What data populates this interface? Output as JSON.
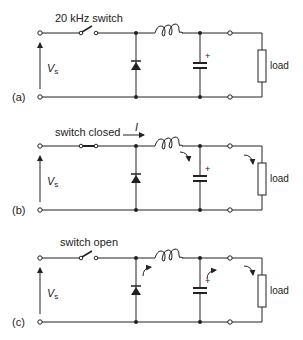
{
  "figure": {
    "panels": [
      {
        "id": "a",
        "label": "(a)",
        "switch_label": "20 kHz switch",
        "switch_state": "open",
        "source_label": "V",
        "source_sub": "s",
        "load_label": "load",
        "cap_polarity": "+",
        "current_label": ""
      },
      {
        "id": "b",
        "label": "(b)",
        "switch_label": "switch closed",
        "switch_state": "closed",
        "source_label": "V",
        "source_sub": "s",
        "load_label": "load",
        "cap_polarity": "+",
        "current_label": "I"
      },
      {
        "id": "c",
        "label": "(c)",
        "switch_label": "switch open",
        "switch_state": "open",
        "source_label": "V",
        "source_sub": "s",
        "load_label": "load",
        "cap_polarity": "+",
        "current_label": ""
      }
    ]
  }
}
